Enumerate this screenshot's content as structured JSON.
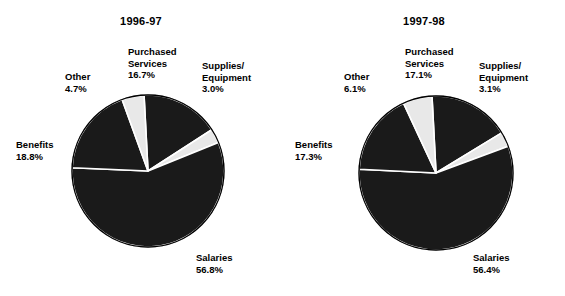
{
  "figure": {
    "background_color": "#ffffff",
    "text_color": "#000000"
  },
  "chart_data": [
    {
      "type": "pie",
      "title": "1996-97",
      "categories": [
        "Purchased Services",
        "Supplies/ Equipment",
        "Salaries",
        "Benefits",
        "Other"
      ],
      "values": [
        16.7,
        3.0,
        56.8,
        18.8,
        4.7
      ],
      "value_labels": [
        "16.7%",
        "3.0%",
        "56.8%",
        "18.8%",
        "4.7%"
      ],
      "colors": [
        "#1a1a1a",
        "#e8e8e8",
        "#1a1a1a",
        "#1a1a1a",
        "#e8e8e8"
      ],
      "start_angle_deg": -3,
      "direction": "clockwise",
      "legend": "none",
      "labels": [
        {
          "name": "Purchased Services",
          "lines": [
            "Purchased",
            "Services"
          ],
          "pct": "16.7%",
          "x": 128,
          "y": 46,
          "align": "left"
        },
        {
          "name": "Supplies/ Equipment",
          "lines": [
            "Supplies/",
            "Equipment"
          ],
          "pct": "3.0%",
          "x": 202,
          "y": 60,
          "align": "left"
        },
        {
          "name": "Other",
          "lines": [
            "Other"
          ],
          "pct": "4.7%",
          "x": 65,
          "y": 71,
          "align": "left"
        },
        {
          "name": "Benefits",
          "lines": [
            "Benefits"
          ],
          "pct": "18.8%",
          "x": 16,
          "y": 139,
          "align": "left"
        },
        {
          "name": "Salaries",
          "lines": [
            "Salaries"
          ],
          "pct": "56.8%",
          "x": 196,
          "y": 252,
          "align": "left"
        }
      ],
      "geometry": {
        "cx": 148,
        "cy": 171,
        "r": 76
      }
    },
    {
      "type": "pie",
      "title": "1997-98",
      "categories": [
        "Purchased Services",
        "Supplies/ Equipment",
        "Salaries",
        "Benefits",
        "Other"
      ],
      "values": [
        17.1,
        3.1,
        56.4,
        17.3,
        6.1
      ],
      "value_labels": [
        "17.1%",
        "3.1%",
        "56.4%",
        "17.3%",
        "6.1%"
      ],
      "colors": [
        "#1a1a1a",
        "#e8e8e8",
        "#1a1a1a",
        "#1a1a1a",
        "#e8e8e8"
      ],
      "start_angle_deg": -3,
      "direction": "clockwise",
      "legend": "none",
      "labels": [
        {
          "name": "Purchased Services",
          "lines": [
            "Purchased",
            "Services"
          ],
          "pct": "17.1%",
          "x": 122,
          "y": 46,
          "align": "left"
        },
        {
          "name": "Supplies/ Equipment",
          "lines": [
            "Supplies/",
            "Equipment"
          ],
          "pct": "3.1%",
          "x": 196,
          "y": 60,
          "align": "left"
        },
        {
          "name": "Other",
          "lines": [
            "Other"
          ],
          "pct": "6.1%",
          "x": 61,
          "y": 71,
          "align": "left"
        },
        {
          "name": "Benefits",
          "lines": [
            "Benefits"
          ],
          "pct": "17.3%",
          "x": 12,
          "y": 139,
          "align": "left"
        },
        {
          "name": "Salaries",
          "lines": [
            "Salaries"
          ],
          "pct": "56.4%",
          "x": 190,
          "y": 252,
          "align": "left"
        }
      ],
      "geometry": {
        "cx": 153,
        "cy": 173,
        "r": 77
      }
    }
  ]
}
